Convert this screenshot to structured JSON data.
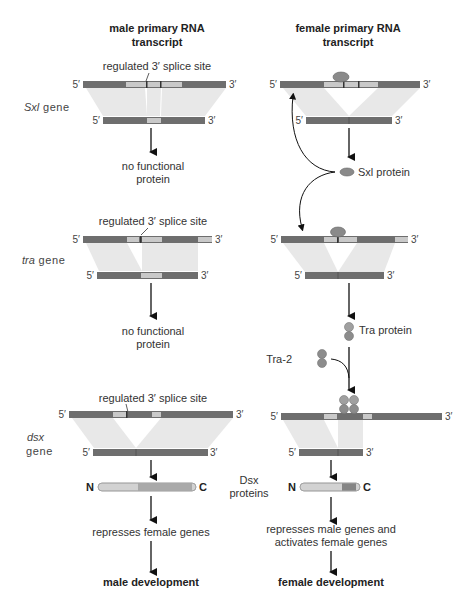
{
  "colors": {
    "intron": "#6e6e6e",
    "exon_light": "#c9c9c9",
    "splice_shade": "#e8e8e8",
    "protein_sxl": "#8a8a8a",
    "protein_tra": "#9a9a9a",
    "protein_n_part": "#d2d2d2",
    "protein_c_part_male": "#a9a9a9",
    "protein_c_part_female": "#858585",
    "arrow": "#111111",
    "text": "#333333"
  },
  "headers": {
    "male_line1": "male primary RNA",
    "male_line2": "transcript",
    "female_line1": "female primary RNA",
    "female_line2": "transcript"
  },
  "ends": {
    "five": "5′",
    "three": "3′"
  },
  "genes": {
    "sxl": {
      "italic": "Sxl",
      "suffix": " gene"
    },
    "tra": {
      "italic": "tra",
      "suffix": " gene"
    },
    "dsx": {
      "italic": "dsx",
      "suffix": "gene"
    }
  },
  "labels": {
    "splice_site": "regulated 3′ splice site",
    "no_functional_1": "no functional",
    "no_functional_2": "protein",
    "sxl_protein": "Sxl protein",
    "tra_protein": "Tra protein",
    "tra2": "Tra-2",
    "dsx_proteins_1": "Dsx",
    "dsx_proteins_2": "proteins",
    "n_term": "N",
    "c_term": "C",
    "male_effect": "represses female genes",
    "female_effect_1": "represses male genes and",
    "female_effect_2": "activates female genes",
    "male_outcome": "male development",
    "female_outcome": "female development"
  }
}
